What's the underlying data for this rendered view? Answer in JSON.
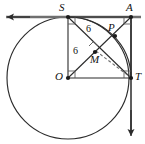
{
  "figure": {
    "type": "geometry-diagram",
    "width": 145,
    "height": 144,
    "colors": {
      "stroke": "#2b2b2b",
      "light_stroke": "#8d8d8d",
      "background": "#ffffff",
      "text": "#111111"
    }
  },
  "points": [
    {
      "id": "S",
      "label": "S",
      "x": 68,
      "y": 17,
      "label_x": 60,
      "label_y": 3,
      "dot": true
    },
    {
      "id": "A",
      "label": "A",
      "x": 131,
      "y": 17,
      "label_x": 127,
      "label_y": 3,
      "dot": true
    },
    {
      "id": "O",
      "label": "O",
      "x": 68,
      "y": 78,
      "label_x": 55,
      "label_y": 71,
      "dot": true
    },
    {
      "id": "T",
      "label": "T",
      "x": 131,
      "y": 78,
      "label_x": 135,
      "label_y": 72,
      "dot": true
    },
    {
      "id": "P",
      "label": "P",
      "x": 115,
      "y": 36,
      "label_x": 108,
      "label_y": 23,
      "dot": true
    },
    {
      "id": "M",
      "label": "M",
      "x": 95,
      "y": 52,
      "label_x": 92,
      "label_y": 56,
      "dot": true
    }
  ],
  "segments": [
    {
      "id": "square-top",
      "from": "S",
      "to": "A",
      "style": "solid"
    },
    {
      "id": "square-left",
      "from": "S",
      "to": "O",
      "style": "solid"
    },
    {
      "id": "square-bottom",
      "from": "O",
      "to": "T",
      "style": "solid"
    },
    {
      "id": "square-right",
      "from": "A",
      "to": "T",
      "style": "solid"
    },
    {
      "id": "diagonal-S-T",
      "from": "S",
      "to": "T",
      "style": "solid"
    },
    {
      "id": "diagonal-O-A",
      "from": "O",
      "to": "A",
      "style": "solid"
    },
    {
      "id": "chord-M-T",
      "from": "M",
      "to": "T",
      "style": "dashed"
    }
  ],
  "circle": {
    "id": "main-circle",
    "center_x": 68,
    "center_y": 78,
    "radius": 61
  },
  "arc": {
    "id": "arc-S-P-T",
    "center": "A",
    "from": "S",
    "to": "T",
    "radius": 63
  },
  "tangent_lines": [
    {
      "id": "tangent-horizontal",
      "x1": 5,
      "y1": 17,
      "x2": 141,
      "y2": 17,
      "arrow": "start"
    },
    {
      "id": "tangent-vertical",
      "x1": 131,
      "y1": 17,
      "x2": 131,
      "y2": 139,
      "arrow": "end"
    }
  ],
  "length_labels": [
    {
      "id": "len-upper",
      "text": "6",
      "x": 88,
      "y": 27
    },
    {
      "id": "len-lower",
      "text": "6",
      "x": 75,
      "y": 50
    }
  ],
  "right_angle_marks": [
    {
      "id": "right-angle-at-S",
      "x": 68,
      "y": 17,
      "dx": 1,
      "dy": 1,
      "size": 6
    },
    {
      "id": "right-angle-at-A",
      "x": 131,
      "y": 17,
      "dx": -1,
      "dy": 1,
      "size": 6
    },
    {
      "id": "right-angle-at-O",
      "x": 68,
      "y": 78,
      "dx": 1,
      "dy": -1,
      "size": 6
    },
    {
      "id": "right-angle-at-T",
      "x": 131,
      "y": 78,
      "dx": -1,
      "dy": -1,
      "size": 6
    },
    {
      "id": "right-angle-at-M",
      "x": 95,
      "y": 52,
      "rotated": true,
      "size": 6
    }
  ]
}
